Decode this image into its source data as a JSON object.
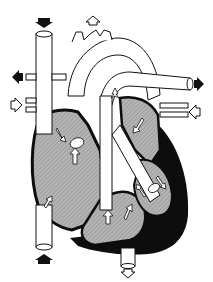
{
  "diagram": {
    "type": "anatomical-illustration",
    "colors": {
      "background": "#ffffff",
      "outline": "#111111",
      "chamber_fill": "#a8a8a8",
      "wall": "#0d0d0d",
      "vessel": "#ffffff",
      "arrow_filled": "#111111",
      "arrow_hollow": "#ffffff"
    },
    "elements": [
      {
        "name": "superior-vena-cava"
      },
      {
        "name": "inferior-vena-cava"
      },
      {
        "name": "aorta"
      },
      {
        "name": "pulmonary-trunk"
      },
      {
        "name": "pulmonary-veins"
      },
      {
        "name": "right-atrium"
      },
      {
        "name": "left-atrium"
      },
      {
        "name": "right-ventricle"
      },
      {
        "name": "left-ventricle"
      },
      {
        "name": "ductus-arteriosus"
      }
    ],
    "flow_arrows": [
      {
        "name": "arrow-svc-in",
        "style": "filled",
        "direction": "down"
      },
      {
        "name": "arrow-ivc-in",
        "style": "filled",
        "direction": "up"
      },
      {
        "name": "arrow-left-out",
        "style": "filled",
        "direction": "left"
      },
      {
        "name": "arrow-left-in",
        "style": "hollow",
        "direction": "right"
      },
      {
        "name": "arrow-aorta-up",
        "style": "hollow",
        "direction": "up"
      },
      {
        "name": "arrow-right-out",
        "style": "filled",
        "direction": "right"
      },
      {
        "name": "arrow-right-in",
        "style": "hollow",
        "direction": "left"
      },
      {
        "name": "arrow-aorta-down",
        "style": "hollow",
        "direction": "down"
      }
    ]
  }
}
